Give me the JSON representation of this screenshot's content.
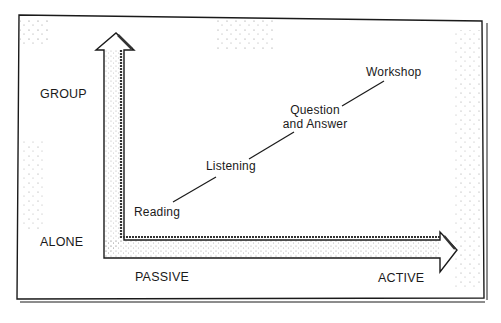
{
  "diagram": {
    "type": "axis-continuum",
    "y_axis": {
      "top_label": "GROUP",
      "bottom_label": "ALONE"
    },
    "x_axis": {
      "left_label": "PASSIVE",
      "right_label": "ACTIVE"
    },
    "continuum": [
      {
        "label": "Reading"
      },
      {
        "label": "Listening"
      },
      {
        "label_line1": "Question",
        "label_line2": "and Answer"
      },
      {
        "label": "Workshop"
      }
    ],
    "colors": {
      "ink": "#1a1a1a",
      "paper": "#ffffff",
      "stipple": "#555555"
    }
  }
}
